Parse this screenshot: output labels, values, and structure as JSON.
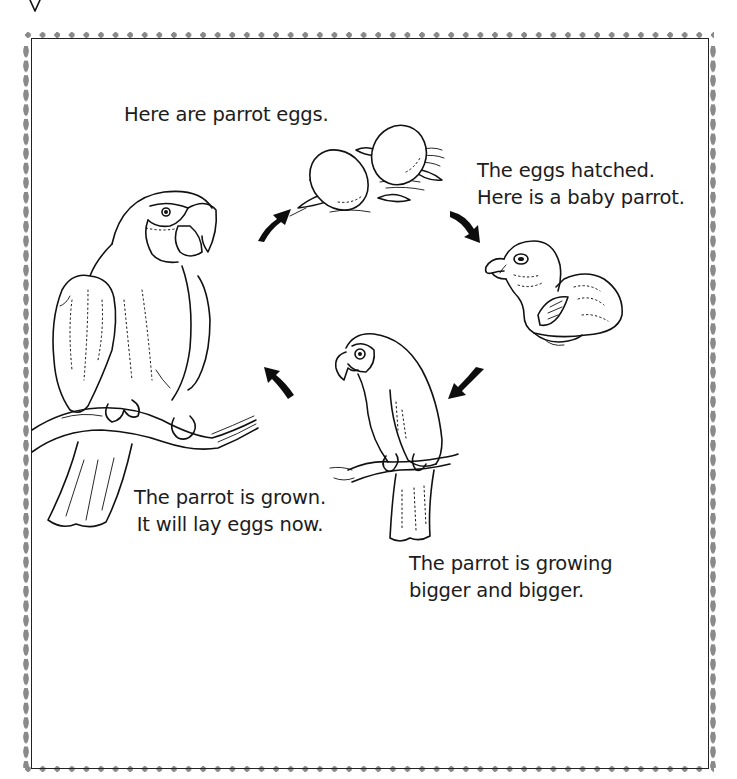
{
  "page": {
    "type": "worksheet"
  },
  "captions": {
    "eggs": "Here are parrot eggs.",
    "hatched_line1": "The eggs hatched.",
    "hatched_line2": "Here is a baby parrot.",
    "growing_line1": "The parrot is growing",
    "growing_line2": "bigger and bigger.",
    "grown_line1": "The parrot is grown.",
    "grown_line2": "It will lay eggs now."
  },
  "cycle": [
    {
      "stage": 1,
      "name": "eggs",
      "illustration": "parrot-eggs-in-nest"
    },
    {
      "stage": 2,
      "name": "baby",
      "illustration": "baby-parrot-hatchling"
    },
    {
      "stage": 3,
      "name": "juvenile",
      "illustration": "young-parrot-on-branch"
    },
    {
      "stage": 4,
      "name": "adult",
      "illustration": "adult-parrot-on-branch"
    }
  ],
  "arrows": [
    {
      "from": "adult",
      "to": "eggs",
      "direction": "up-right"
    },
    {
      "from": "eggs",
      "to": "baby",
      "direction": "down-right"
    },
    {
      "from": "baby",
      "to": "juvenile",
      "direction": "down-left"
    },
    {
      "from": "juvenile",
      "to": "adult",
      "direction": "up-left"
    }
  ],
  "style": {
    "border_color": "#222222",
    "dot_color": "#8a8a8a",
    "text_color": "#1c1c1c"
  }
}
